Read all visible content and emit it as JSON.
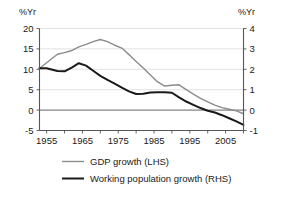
{
  "chart_data": {
    "type": "line",
    "title": "",
    "xlabel": "",
    "ylabel": "%Yr",
    "y2label": "%Yr",
    "grid": true,
    "legend_position": "bottom",
    "xlim": [
      1953,
      2010
    ],
    "ylim": [
      -5,
      20
    ],
    "y2lim": [
      -1,
      4
    ],
    "x_ticks_major": [
      1955,
      1965,
      1975,
      1985,
      1995,
      2005
    ],
    "x_ticks_minor": [
      1955,
      1960,
      1965,
      1970,
      1975,
      1980,
      1985,
      1990,
      1995,
      2000,
      2005,
      2010
    ],
    "x_tick_labels": [
      "1955",
      "1965",
      "1975",
      "1985",
      "1995",
      "2005"
    ],
    "y_ticks": [
      20,
      15,
      10,
      5,
      0,
      -5
    ],
    "y_tick_labels": [
      "20",
      "15",
      "10",
      "5",
      "0",
      "-5"
    ],
    "y2_ticks": [
      4,
      3,
      2,
      1,
      0,
      -1
    ],
    "y2_tick_labels": [
      "4",
      "3",
      "2",
      "1",
      "0",
      "-1"
    ],
    "x": [
      1953,
      1955,
      1958,
      1960,
      1962,
      1964,
      1966,
      1968,
      1970,
      1972,
      1974,
      1976,
      1978,
      1980,
      1982,
      1984,
      1986,
      1988,
      1990,
      1992,
      1994,
      1996,
      1998,
      2000,
      2002,
      2004,
      2006,
      2008,
      2010
    ],
    "series": [
      {
        "name": "GDP growth (LHS)",
        "axis": "left",
        "color": "#8c8c8c",
        "width": 1.4,
        "values": [
          10.2,
          11.6,
          13.7,
          14.1,
          14.6,
          15.5,
          16.1,
          16.8,
          17.3,
          16.8,
          15.9,
          15.2,
          13.6,
          11.9,
          10.3,
          8.6,
          6.9,
          5.9,
          6.1,
          6.2,
          5.0,
          3.9,
          2.9,
          2.0,
          1.2,
          0.6,
          0.2,
          -0.2,
          -0.9
        ]
      },
      {
        "name": "Working population growth (RHS)",
        "axis": "right",
        "color": "#1a1a1a",
        "width": 2.0,
        "values": [
          2.05,
          2.05,
          1.92,
          1.9,
          2.08,
          2.3,
          2.18,
          1.93,
          1.68,
          1.48,
          1.3,
          1.1,
          0.92,
          0.79,
          0.8,
          0.86,
          0.88,
          0.88,
          0.85,
          0.62,
          0.42,
          0.26,
          0.1,
          -0.03,
          -0.12,
          -0.25,
          -0.4,
          -0.55,
          -0.72
        ]
      }
    ]
  },
  "legend": {
    "items": [
      {
        "label": "GDP growth (LHS)",
        "color": "#8c8c8c"
      },
      {
        "label": "Working population growth (RHS)",
        "color": "#1a1a1a"
      }
    ]
  },
  "axes": {
    "left_unit": "%Yr",
    "right_unit": "%Yr"
  }
}
